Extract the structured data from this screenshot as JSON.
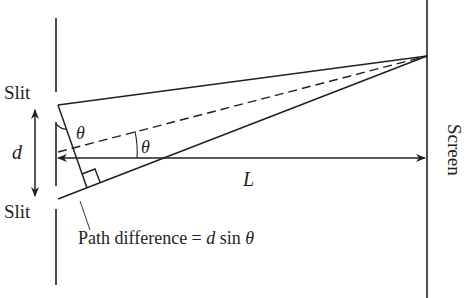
{
  "diagram": {
    "colors": {
      "stroke": "#231f20",
      "background": "#ffffff"
    },
    "labels": {
      "slit_top": "Slit",
      "slit_bottom": "Slit",
      "slit_separation": "d",
      "angle_at_slit": "θ",
      "angle_at_center": "θ",
      "distance": "L",
      "screen": "Screen",
      "path_difference": "Path difference = ",
      "path_difference_d": "d",
      "path_difference_sin": " sin ",
      "path_difference_theta": "θ"
    }
  }
}
